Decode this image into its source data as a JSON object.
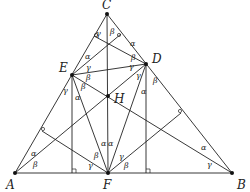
{
  "diagram": {
    "points": {
      "A": {
        "label": "A",
        "x": 15,
        "y": 173,
        "lx": 6,
        "ly": 189
      },
      "B": {
        "label": "B",
        "x": 232,
        "y": 173,
        "lx": 237,
        "ly": 189
      },
      "C": {
        "label": "C",
        "x": 107,
        "y": 14,
        "lx": 102,
        "ly": 9
      },
      "D": {
        "label": "D",
        "x": 146,
        "y": 64,
        "lx": 152,
        "ly": 63
      },
      "E": {
        "label": "E",
        "x": 72,
        "y": 75,
        "lx": 59,
        "ly": 72
      },
      "F": {
        "label": "F",
        "x": 108,
        "y": 173,
        "lx": 103,
        "ly": 189
      },
      "H": {
        "label": "H",
        "x": 108,
        "y": 96,
        "lx": 114,
        "ly": 103
      }
    },
    "angle_labels": [
      {
        "t": "γ",
        "x": 96,
        "y": 36
      },
      {
        "t": "β",
        "x": 110,
        "y": 34
      },
      {
        "t": "α",
        "x": 85,
        "y": 59
      },
      {
        "t": "α",
        "x": 130,
        "y": 46
      },
      {
        "t": "γ",
        "x": 86,
        "y": 70
      },
      {
        "t": "β",
        "x": 131,
        "y": 60
      },
      {
        "t": "β",
        "x": 86,
        "y": 80
      },
      {
        "t": "γ",
        "x": 129,
        "y": 69
      },
      {
        "t": "β",
        "x": 81,
        "y": 89
      },
      {
        "t": "γ",
        "x": 136,
        "y": 78
      },
      {
        "t": "γ",
        "x": 63,
        "y": 93
      },
      {
        "t": "β",
        "x": 153,
        "y": 83
      },
      {
        "t": "α",
        "x": 75,
        "y": 100
      },
      {
        "t": "α",
        "x": 141,
        "y": 94
      },
      {
        "t": "α",
        "x": 31,
        "y": 156
      },
      {
        "t": "β",
        "x": 33,
        "y": 167
      },
      {
        "t": "α",
        "x": 201,
        "y": 150
      },
      {
        "t": "γ",
        "x": 207,
        "y": 167
      },
      {
        "t": "α",
        "x": 101,
        "y": 146
      },
      {
        "t": "α",
        "x": 108,
        "y": 146
      },
      {
        "t": "β",
        "x": 94,
        "y": 158
      },
      {
        "t": "γ",
        "x": 119,
        "y": 159
      },
      {
        "t": "γ",
        "x": 88,
        "y": 168
      },
      {
        "t": "β",
        "x": 124,
        "y": 168
      }
    ]
  }
}
